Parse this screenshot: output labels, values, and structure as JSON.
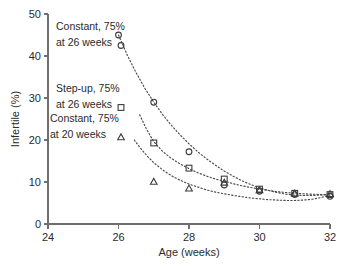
{
  "chart_data": {
    "type": "scatter",
    "title": "",
    "xlabel": "Age (weeks)",
    "ylabel": "Infertile (%)",
    "xlim": [
      24,
      32
    ],
    "ylim": [
      0,
      50
    ],
    "xticks": [
      24,
      26,
      28,
      30,
      32
    ],
    "yticks": [
      0,
      10,
      20,
      30,
      40,
      50
    ],
    "grid": false,
    "legend_position": "upper-left-inside",
    "series": [
      {
        "name": "Constant, 75% at 26 weeks",
        "marker": "circle",
        "x": [
          26,
          27,
          28,
          29,
          30,
          31,
          32
        ],
        "values": [
          45.0,
          29.0,
          17.2,
          9.3,
          7.8,
          7.0,
          6.6
        ]
      },
      {
        "name": "Step-up, 75% at 26 weeks",
        "marker": "square",
        "x": [
          27,
          28,
          29,
          30,
          31,
          32
        ],
        "values": [
          19.3,
          13.3,
          10.7,
          8.3,
          7.3,
          7.0
        ]
      },
      {
        "name": "Constant, 75% at 20 weeks",
        "marker": "triangle",
        "x": [
          27,
          28,
          29,
          30,
          31,
          32
        ],
        "values": [
          10.0,
          8.4,
          9.8,
          8.0,
          7.2,
          7.1
        ]
      }
    ],
    "fit_curves": [
      {
        "name": "Constant, 75% at 26 weeks fit",
        "points": [
          [
            26.0,
            45.0
          ],
          [
            26.25,
            40.2
          ],
          [
            26.5,
            36.0
          ],
          [
            26.75,
            32.3
          ],
          [
            27.0,
            29.0
          ],
          [
            27.25,
            26.1
          ],
          [
            27.5,
            23.5
          ],
          [
            27.75,
            21.2
          ],
          [
            28.0,
            19.1
          ],
          [
            28.25,
            17.2
          ],
          [
            28.5,
            15.5
          ],
          [
            28.75,
            14.0
          ],
          [
            29.0,
            12.6
          ],
          [
            29.25,
            11.4
          ],
          [
            29.5,
            10.3
          ],
          [
            29.75,
            9.4
          ],
          [
            30.0,
            8.6
          ],
          [
            30.25,
            8.0
          ],
          [
            30.5,
            7.5
          ],
          [
            30.75,
            7.1
          ],
          [
            31.0,
            6.9
          ],
          [
            31.25,
            6.8
          ],
          [
            31.5,
            6.8
          ],
          [
            31.75,
            6.9
          ],
          [
            32.0,
            7.1
          ]
        ]
      },
      {
        "name": "Step-up, 75% at 26 weeks fit",
        "points": [
          [
            26.6,
            26.0
          ],
          [
            26.8,
            22.5
          ],
          [
            27.0,
            19.6
          ],
          [
            27.25,
            17.3
          ],
          [
            27.5,
            15.6
          ],
          [
            27.75,
            14.3
          ],
          [
            28.0,
            13.2
          ],
          [
            28.25,
            12.2
          ],
          [
            28.5,
            11.4
          ],
          [
            28.75,
            10.7
          ],
          [
            29.0,
            10.2
          ],
          [
            29.25,
            9.6
          ],
          [
            29.5,
            9.1
          ],
          [
            29.75,
            8.7
          ],
          [
            30.0,
            8.3
          ],
          [
            30.25,
            8.0
          ],
          [
            30.5,
            7.7
          ],
          [
            30.75,
            7.5
          ],
          [
            31.0,
            7.3
          ],
          [
            31.25,
            7.2
          ],
          [
            31.5,
            7.1
          ],
          [
            31.75,
            7.0
          ],
          [
            32.0,
            7.0
          ]
        ]
      },
      {
        "name": "Constant, 75% at 20 weeks fit",
        "points": [
          [
            26.45,
            20.0
          ],
          [
            26.6,
            18.3
          ],
          [
            26.8,
            16.3
          ],
          [
            27.0,
            14.6
          ],
          [
            27.25,
            12.9
          ],
          [
            27.5,
            11.5
          ],
          [
            27.75,
            10.4
          ],
          [
            28.0,
            9.5
          ],
          [
            28.25,
            8.8
          ],
          [
            28.5,
            8.1
          ],
          [
            28.75,
            7.6
          ],
          [
            29.0,
            7.2
          ],
          [
            29.25,
            6.8
          ],
          [
            29.5,
            6.5
          ],
          [
            29.75,
            6.2
          ],
          [
            30.0,
            6.0
          ],
          [
            30.25,
            5.8
          ],
          [
            30.5,
            5.7
          ],
          [
            30.75,
            5.6
          ],
          [
            31.0,
            5.6
          ],
          [
            31.25,
            5.7
          ],
          [
            31.5,
            5.9
          ],
          [
            31.75,
            6.3
          ],
          [
            32.0,
            6.9
          ]
        ]
      }
    ]
  },
  "axes": {
    "x_label": "Age (weeks)",
    "y_label": "Infertile (%)",
    "x_tick_labels": [
      "24",
      "26",
      "28",
      "30",
      "32"
    ],
    "y_tick_labels": [
      "0",
      "10",
      "20",
      "30",
      "40",
      "50"
    ]
  },
  "legend": {
    "entries": [
      {
        "line1": "Constant, 75%",
        "line2": "at 26 weeks",
        "marker": "circle",
        "marker_name": "circle-marker-icon"
      },
      {
        "line1": "Step-up, 75%",
        "line2": "at 26 weeks",
        "marker": "square",
        "marker_name": "square-marker-icon"
      },
      {
        "line1": "Constant, 75%",
        "line2": "at 20 weeks",
        "marker": "triangle",
        "marker_name": "triangle-marker-icon"
      }
    ]
  },
  "colors": {
    "axis": "#6f6f6f",
    "text": "#2b2b2b",
    "marker": "#3d3d3d",
    "curve": "#4a4a4a",
    "background": "#ffffff"
  }
}
